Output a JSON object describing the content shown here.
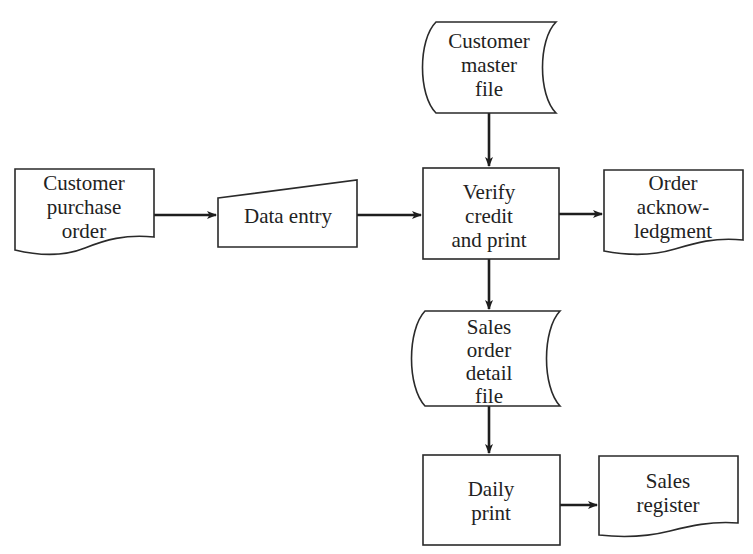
{
  "diagram": {
    "type": "system flowchart",
    "colors": {
      "line": "#2a2a2a",
      "text": "#222222",
      "background": "#ffffff"
    },
    "nodes": [
      {
        "id": "customer_purchase_order",
        "shape": "document",
        "lines": [
          "Customer",
          "purchase",
          "order"
        ]
      },
      {
        "id": "data_entry",
        "shape": "manual-input",
        "lines": [
          "Data entry"
        ]
      },
      {
        "id": "customer_master_file",
        "shape": "stored-data",
        "lines": [
          "Customer",
          "master",
          "file"
        ]
      },
      {
        "id": "verify_credit_and_print",
        "shape": "process",
        "lines": [
          "Verify",
          "credit",
          "and print"
        ]
      },
      {
        "id": "order_acknowledgment",
        "shape": "document",
        "lines": [
          "Order",
          "acknow-",
          "ledgment"
        ]
      },
      {
        "id": "sales_order_detail_file",
        "shape": "stored-data",
        "lines": [
          "Sales",
          "order",
          "detail",
          "file"
        ]
      },
      {
        "id": "daily_print",
        "shape": "process",
        "lines": [
          "Daily",
          "print"
        ]
      },
      {
        "id": "sales_register",
        "shape": "document",
        "lines": [
          "Sales",
          "register"
        ]
      }
    ],
    "edges": [
      {
        "from": "customer_purchase_order",
        "to": "data_entry"
      },
      {
        "from": "data_entry",
        "to": "verify_credit_and_print"
      },
      {
        "from": "customer_master_file",
        "to": "verify_credit_and_print"
      },
      {
        "from": "verify_credit_and_print",
        "to": "order_acknowledgment"
      },
      {
        "from": "verify_credit_and_print",
        "to": "sales_order_detail_file"
      },
      {
        "from": "sales_order_detail_file",
        "to": "daily_print"
      },
      {
        "from": "daily_print",
        "to": "sales_register"
      }
    ]
  }
}
